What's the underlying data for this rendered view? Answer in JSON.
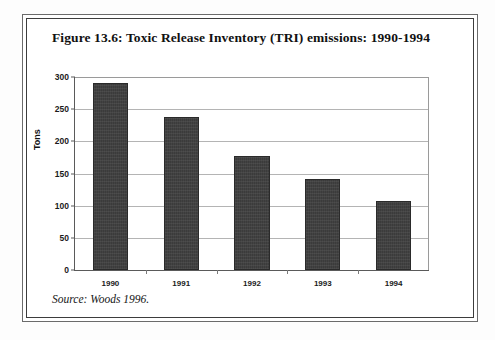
{
  "figure": {
    "title": "Figure 13.6: Toxic Release Inventory (TRI) emissions: 1990-1994",
    "source_note": "Source: Woods 1996."
  },
  "chart_data": {
    "type": "bar",
    "title": "Figure 13.6: Toxic Release Inventory (TRI) emissions: 1990-1994",
    "categories": [
      "1990",
      "1991",
      "1992",
      "1993",
      "1994"
    ],
    "values": [
      290,
      238,
      178,
      142,
      108
    ],
    "xlabel": "",
    "ylabel": "Tons",
    "ylim": [
      0,
      300
    ],
    "ytick_values": [
      0,
      50,
      100,
      150,
      200,
      250,
      300
    ],
    "ytick_labels": [
      "0",
      "50",
      "100",
      "150",
      "200",
      "250",
      "300"
    ],
    "grid": true,
    "legend": false,
    "bar_color": "#3b3b3b",
    "series": [
      {
        "name": "TRI emissions",
        "values": [
          290,
          238,
          178,
          142,
          108
        ]
      }
    ]
  }
}
